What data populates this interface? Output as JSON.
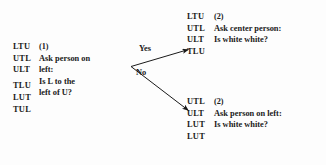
{
  "figure": {
    "type": "decision-tree",
    "background_color": "#fdfdfd",
    "text_color": "#1a1a1a"
  },
  "nodes": {
    "root": {
      "marker": "(1)",
      "permutations": [
        "LTU",
        "UTL",
        "ULT",
        "TLU",
        "LUT",
        "TUL"
      ],
      "gap_after_index": 2,
      "question_lines": [
        "Ask person on",
        "left:",
        "Is L to the",
        "left of U?"
      ]
    },
    "yes_branch": {
      "marker": "(2)",
      "permutations": [
        "LTU",
        "UTL",
        "ULT",
        "TLU"
      ],
      "question_lines": [
        "Ask center person:",
        "Is white white?"
      ]
    },
    "no_branch": {
      "marker": "(2)",
      "permutations": [
        "UTL",
        "ULT",
        "LUT",
        "LUT"
      ],
      "question_lines": [
        "Ask person on left:",
        "Is white white?"
      ]
    }
  },
  "edges": {
    "yes_label": "Yes",
    "no_label": "No"
  }
}
